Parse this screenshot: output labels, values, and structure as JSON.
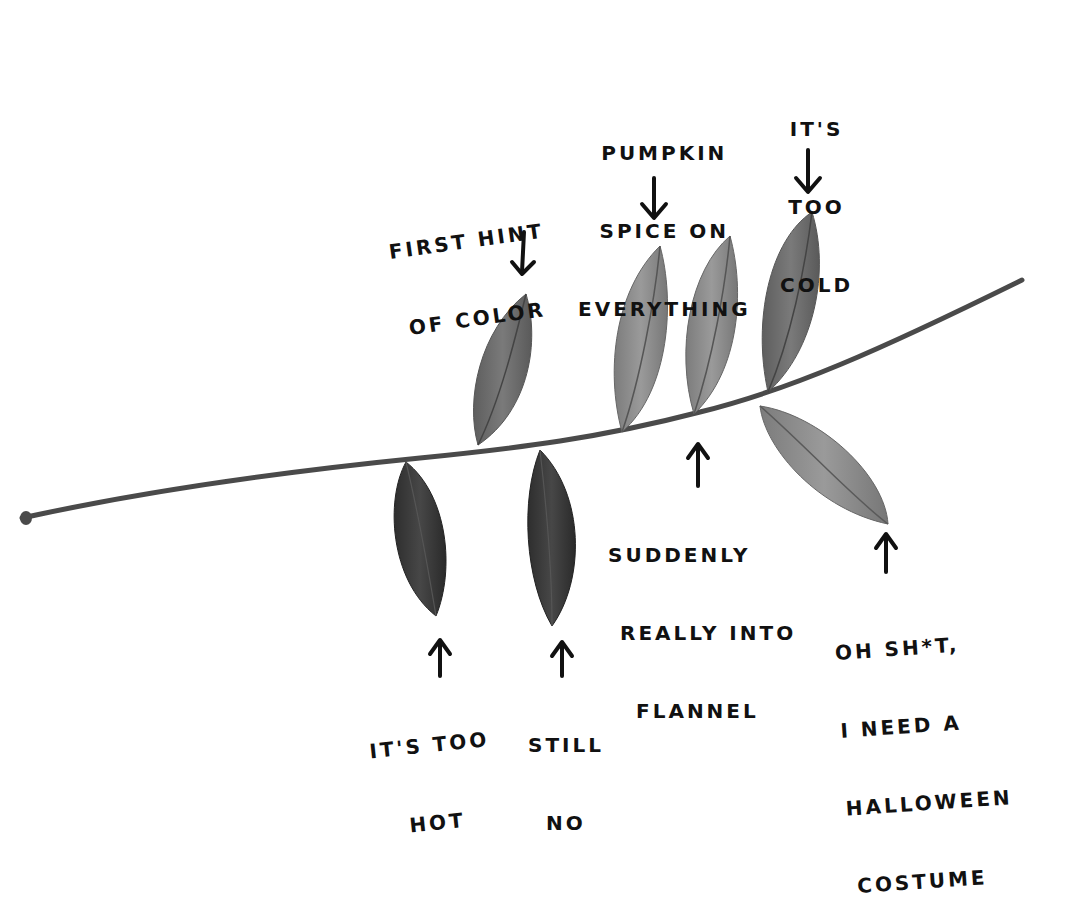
{
  "colors": {
    "background": "#ffffff",
    "ink": "#111111",
    "stem": "#4a4a4a",
    "leaf_dark": "#3a3a3a",
    "leaf_mid": "#6e6e6e",
    "leaf_light": "#8e8e8e",
    "leaf_lighter": "#9a9a9a"
  },
  "labels": {
    "first_hint": {
      "lines": [
        "FIRST HINT",
        "OF COLOR"
      ],
      "arrow": "down"
    },
    "pumpkin_spice": {
      "lines": [
        "PUMPKIN",
        "SPICE ON",
        "EVERYTHING"
      ],
      "arrow": "down"
    },
    "too_cold": {
      "lines": [
        "IT'S",
        "TOO",
        "COLD"
      ],
      "arrow": "down"
    },
    "too_hot": {
      "lines": [
        "IT'S TOO",
        "HOT"
      ],
      "arrow": "up"
    },
    "still_no": {
      "lines": [
        "STILL",
        "NO"
      ],
      "arrow": "up"
    },
    "flannel": {
      "lines": [
        "SUDDENLY",
        "REALLY INTO",
        "FLANNEL"
      ],
      "arrow": "up"
    },
    "halloween": {
      "lines": [
        "OH SH*T,",
        "I NEED A",
        "HALLOWEEN",
        "COSTUME"
      ],
      "arrow": "up"
    }
  },
  "leaves": [
    {
      "id": "leaf-first-hint",
      "position": "above",
      "shade": "leaf_mid"
    },
    {
      "id": "leaf-pumpkin-spice",
      "position": "above",
      "shade": "leaf_light"
    },
    {
      "id": "leaf-flannel",
      "position": "above",
      "shade": "leaf_light"
    },
    {
      "id": "leaf-too-cold",
      "position": "above",
      "shade": "leaf_mid"
    },
    {
      "id": "leaf-too-hot",
      "position": "below",
      "shade": "leaf_dark"
    },
    {
      "id": "leaf-still-no",
      "position": "below",
      "shade": "leaf_dark"
    },
    {
      "id": "leaf-halloween",
      "position": "below",
      "shade": "leaf_lighter"
    }
  ]
}
